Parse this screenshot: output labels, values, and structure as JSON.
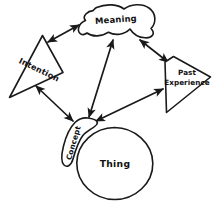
{
  "diagram": {
    "background_color": "#ffffff",
    "ink_color": "#1a1a1a",
    "style": "hand-drawn",
    "nodes": [
      {
        "id": "meaning",
        "label": "Meaning",
        "shape": "blob",
        "position": "top-center",
        "label_rotation": -4
      },
      {
        "id": "intention",
        "label": "Intention",
        "shape": "triangle",
        "position": "left",
        "label_rotation": 26
      },
      {
        "id": "past_experience",
        "label_line1": "Past",
        "label_line2": "Experience",
        "label": "Past Experience",
        "shape": "quadrilateral",
        "position": "right",
        "label_rotation": 0
      },
      {
        "id": "concept",
        "label": "Concept",
        "shape": "narrow-blob",
        "position": "bottom-left-of-thing",
        "label_rotation": -74
      },
      {
        "id": "thing",
        "label": "Thing",
        "shape": "circle",
        "position": "bottom-center",
        "label_rotation": 0
      }
    ],
    "links": [
      {
        "id": "intention-meaning",
        "from": "Intention",
        "to": "Meaning",
        "arrows": "both"
      },
      {
        "id": "meaning-past-experience",
        "from": "Meaning",
        "to": "Past Experience",
        "arrows": "both"
      },
      {
        "id": "meaning-concept",
        "from": "Meaning",
        "to": "Concept",
        "arrows": "both"
      },
      {
        "id": "intention-concept",
        "from": "Intention",
        "to": "Concept",
        "arrows": "both"
      },
      {
        "id": "past-experience-concept",
        "from": "Past Experience",
        "to": "Concept",
        "arrows": "both"
      }
    ]
  }
}
